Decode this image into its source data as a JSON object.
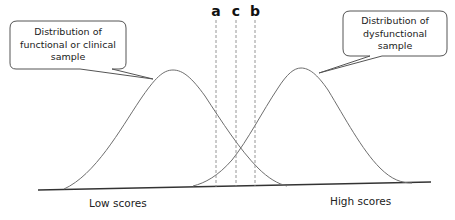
{
  "diagram": {
    "type": "overlapping-normal-distributions",
    "callouts": {
      "left": {
        "lines": [
          "Distribution of",
          "functional or clinical",
          "sample"
        ]
      },
      "right": {
        "lines": [
          "Distribution of",
          "dysfunctional",
          "sample"
        ]
      }
    },
    "markers": [
      {
        "id": "a",
        "label": "a",
        "x": 216
      },
      {
        "id": "c",
        "label": "c",
        "x": 236
      },
      {
        "id": "b",
        "label": "b",
        "x": 255
      }
    ],
    "axis_labels": {
      "low": "Low scores",
      "high": "High scores"
    },
    "colors": {
      "curve": "#6e6e6e",
      "baseline": "#333333",
      "dashed": "#8a8a8a",
      "callout_border": "#555555"
    }
  }
}
